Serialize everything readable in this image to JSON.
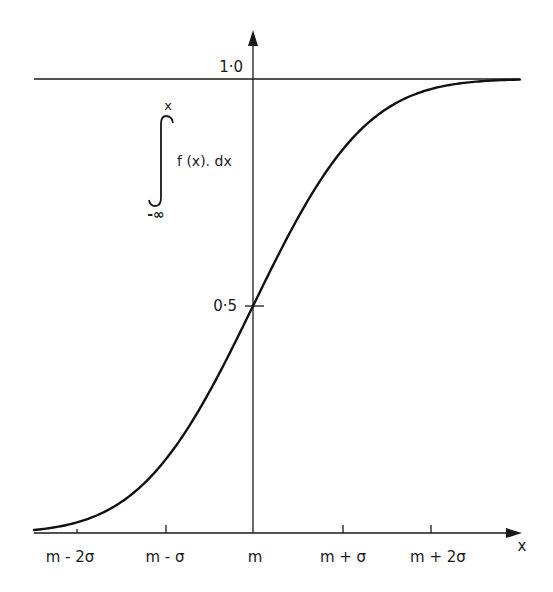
{
  "chart_data": {
    "type": "line",
    "title": "",
    "xlabel": "x",
    "ylabel_expression": "∫ f(x). dx from -∞ to x",
    "ylabel_parts": {
      "upper_limit": "x",
      "integrand": "f (x). dx",
      "lower_limit": "-∞"
    },
    "x_ticks": [
      "m - 2σ",
      "m - σ",
      "m",
      "m + σ",
      "m + 2σ"
    ],
    "x_ticks_sigma": [
      -2,
      -1,
      0,
      1,
      2
    ],
    "y_ticks": [
      "0·5",
      "1·0"
    ],
    "y_ticks_values": [
      0.5,
      1.0
    ],
    "ylim": [
      0,
      1.0
    ],
    "xlim_sigma": [
      -2.5,
      3.0
    ],
    "grid": false,
    "reference_lines": [
      {
        "y": 1.0,
        "label": "1·0"
      }
    ],
    "series": [
      {
        "name": "normal CDF",
        "x_sigma": [
          -2.5,
          -2.0,
          -1.5,
          -1.0,
          -0.5,
          0.0,
          0.5,
          1.0,
          1.5,
          2.0,
          2.5,
          3.0
        ],
        "values": [
          0.006,
          0.023,
          0.067,
          0.159,
          0.309,
          0.5,
          0.691,
          0.841,
          0.933,
          0.977,
          0.994,
          0.999
        ]
      }
    ]
  },
  "labels": {
    "y_tick_top": "1·0",
    "y_tick_mid": "0·5",
    "x_axis_name": "x",
    "integral_upper": "x",
    "integral_body": "f (x). dx",
    "integral_lower": "-∞",
    "x_ticks": [
      "m - 2σ",
      "m - σ",
      "m",
      "m + σ",
      "m + 2σ"
    ]
  }
}
